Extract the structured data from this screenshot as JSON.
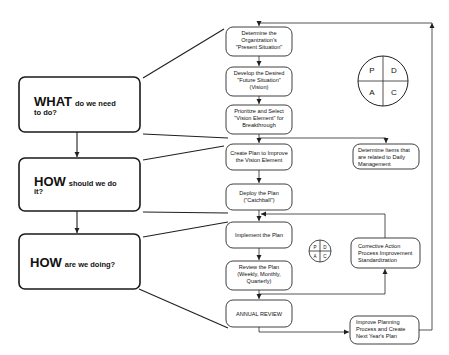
{
  "diagram": {
    "type": "flowchart",
    "questions": [
      {
        "id": "what",
        "keyword": "WHAT",
        "rest_line1": "do we need",
        "rest_line2": "to do?"
      },
      {
        "id": "how_do",
        "keyword": "HOW",
        "rest_line1": "should we do",
        "rest_line2": "it?"
      },
      {
        "id": "how_doing",
        "keyword": "HOW",
        "rest_line1": "are we doing?",
        "rest_line2": ""
      }
    ],
    "steps": [
      {
        "id": "s1",
        "lines": [
          "Determine the",
          "Organization's",
          "\"Present Situation\""
        ]
      },
      {
        "id": "s2",
        "lines": [
          "Develop the Desired",
          "\"Future Situation\"",
          "(Vision)"
        ]
      },
      {
        "id": "s3",
        "lines": [
          "Prioritize and Select",
          "\"Vision Element\" for",
          "Breakthrough"
        ]
      },
      {
        "id": "s4",
        "lines": [
          "Create Plan to Improve",
          "the Vision Element"
        ]
      },
      {
        "id": "s5",
        "lines": [
          "Deploy the Plan",
          "(\"Catchball\")"
        ]
      },
      {
        "id": "s6",
        "lines": [
          "Implement the Plan"
        ]
      },
      {
        "id": "s7",
        "lines": [
          "Review the Plan",
          "(Weekly, Monthly,",
          "Quarterly)"
        ]
      },
      {
        "id": "s8",
        "lines": [
          "ANNUAL REVIEW"
        ]
      }
    ],
    "side_boxes": [
      {
        "id": "daily",
        "lines": [
          "Determine  Items that",
          "are related to Daily",
          "Management"
        ]
      },
      {
        "id": "corrective",
        "lines": [
          "Corrective Action",
          "Process Improvement",
          "Standardization"
        ]
      },
      {
        "id": "improve",
        "lines": [
          "Improve Planning",
          "Process and Create",
          "Next Year's Plan"
        ]
      }
    ],
    "pdca": {
      "p": "P",
      "d": "D",
      "a": "A",
      "c": "C"
    }
  }
}
